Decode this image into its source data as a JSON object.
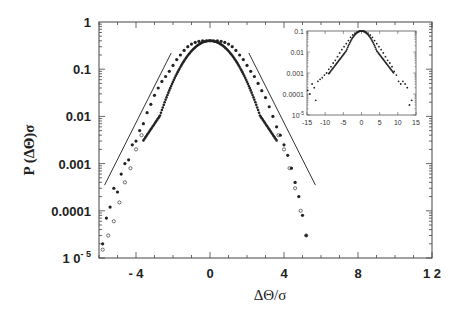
{
  "chart_data": {
    "type": "scatter",
    "title": "",
    "xlabel": "ΔΘ/σ",
    "ylabel": "P (ΔΘ)σ",
    "xlim": [
      -6,
      12
    ],
    "ylim": [
      1e-05,
      1
    ],
    "yscale": "log",
    "grid": false,
    "x_ticks": [
      -4,
      0,
      4,
      8,
      12
    ],
    "x_tick_labels": [
      "- 4",
      "0",
      "4",
      "8",
      "1 2"
    ],
    "y_ticks": [
      1,
      0.1,
      0.01,
      0.001,
      0.0001,
      1e-05
    ],
    "y_tick_labels": [
      "1",
      "0.1",
      "0.01",
      "0.001",
      "0.0001",
      "1 0-5"
    ],
    "series": [
      {
        "name": "filled-points",
        "marker": "filled-circle",
        "x": [
          -5.8,
          -5.6,
          -5.4,
          -5.2,
          -5.0,
          -4.8,
          -4.6,
          -4.4,
          -4.2,
          -4.0,
          -3.8,
          -3.6,
          -3.4,
          -3.2,
          -3.0,
          -2.8,
          -2.6,
          -2.4,
          -2.2,
          -2.0,
          -1.8,
          -1.6,
          -1.4,
          -1.2,
          -1.0,
          -0.8,
          -0.6,
          -0.4,
          -0.2,
          0.0,
          0.2,
          0.4,
          0.6,
          0.8,
          1.0,
          1.2,
          1.4,
          1.6,
          1.8,
          2.0,
          2.2,
          2.4,
          2.6,
          2.8,
          3.0,
          3.2,
          3.4,
          3.6,
          3.8,
          4.0,
          4.2,
          4.4,
          4.6,
          4.8,
          5.0,
          5.2
        ],
        "y": [
          2e-05,
          7e-05,
          0.00012,
          0.0003,
          0.00025,
          0.0006,
          0.001,
          0.0012,
          0.0025,
          0.003,
          0.005,
          0.007,
          0.012,
          0.018,
          0.028,
          0.04,
          0.055,
          0.07,
          0.09,
          0.12,
          0.16,
          0.2,
          0.25,
          0.3,
          0.34,
          0.37,
          0.39,
          0.4,
          0.4,
          0.4,
          0.4,
          0.4,
          0.39,
          0.37,
          0.34,
          0.3,
          0.25,
          0.2,
          0.16,
          0.12,
          0.09,
          0.07,
          0.05,
          0.035,
          0.025,
          0.016,
          0.01,
          0.006,
          0.004,
          0.0025,
          0.0015,
          0.0008,
          0.0004,
          0.0002,
          8e-05,
          3e-05
        ]
      },
      {
        "name": "open-points",
        "marker": "open-circle",
        "x": [
          -5.8,
          -5.5,
          -5.2,
          -4.9,
          -4.6,
          -4.3,
          -4.0,
          -3.7,
          3.7,
          4.0,
          4.3,
          4.6,
          4.9,
          5.2
        ],
        "y": [
          1.5e-05,
          3e-05,
          6e-05,
          0.00015,
          0.0004,
          0.0008,
          0.002,
          0.004,
          0.004,
          0.002,
          0.0008,
          0.0003,
          0.0001,
          3e-05
        ]
      }
    ],
    "reference_lines": [
      {
        "name": "left-slope-line",
        "x": [
          -5.7,
          -2.1
        ],
        "y": [
          0.00035,
          0.22
        ]
      },
      {
        "name": "right-slope-line",
        "x": [
          2.1,
          5.7
        ],
        "y": [
          0.22,
          0.00035
        ]
      }
    ],
    "inset": {
      "type": "scatter",
      "xlim": [
        -15,
        15
      ],
      "ylim": [
        1e-05,
        0.1
      ],
      "yscale": "log",
      "x_ticks": [
        -15,
        -10,
        -5,
        0,
        5,
        10,
        15
      ],
      "x_tick_labels": [
        "-15",
        "-10",
        "-5",
        "0",
        "5",
        "10",
        "15"
      ],
      "y_ticks": [
        0.1,
        0.01,
        0.001,
        0.0001,
        1e-05
      ],
      "y_tick_labels": [
        "0.1",
        "0.01",
        "0.001",
        "0.0001",
        "10-5"
      ],
      "x": [
        -14.8,
        -14.2,
        -13.6,
        -13.0,
        -12.6,
        -12.0,
        -11.4,
        -10.8,
        -10.2,
        -9.6,
        -9.0,
        -8.4,
        -7.8,
        -7.2,
        -6.6,
        -6.0,
        -5.4,
        -4.8,
        -4.2,
        -3.6,
        -3.0,
        -2.4,
        -1.8,
        -1.2,
        -0.6,
        0,
        0.6,
        1.2,
        1.8,
        2.4,
        3.0,
        3.6,
        4.2,
        4.8,
        5.4,
        6.0,
        6.6,
        7.2,
        7.8,
        8.4,
        9.0,
        9.6,
        10.2,
        10.8,
        11.4,
        12.0,
        12.6,
        13.2,
        13.8
      ],
      "y": [
        0.00015,
        0.0001,
        0.0003,
        0.0002,
        5e-05,
        0.0004,
        0.0005,
        0.0006,
        0.0008,
        0.001,
        0.0015,
        0.002,
        0.003,
        0.004,
        0.006,
        0.009,
        0.013,
        0.018,
        0.025,
        0.035,
        0.05,
        0.065,
        0.08,
        0.09,
        0.1,
        0.1,
        0.1,
        0.09,
        0.08,
        0.065,
        0.05,
        0.035,
        0.025,
        0.018,
        0.013,
        0.009,
        0.006,
        0.004,
        0.003,
        0.002,
        0.0012,
        0.0008,
        0.0004,
        0.0003,
        0.0004,
        0.0003,
        0.0002,
        3e-05,
        5e-05
      ]
    }
  },
  "labels": {
    "ylabel": "P (ΔΘ)σ",
    "xlabel": "ΔΘ/σ"
  }
}
